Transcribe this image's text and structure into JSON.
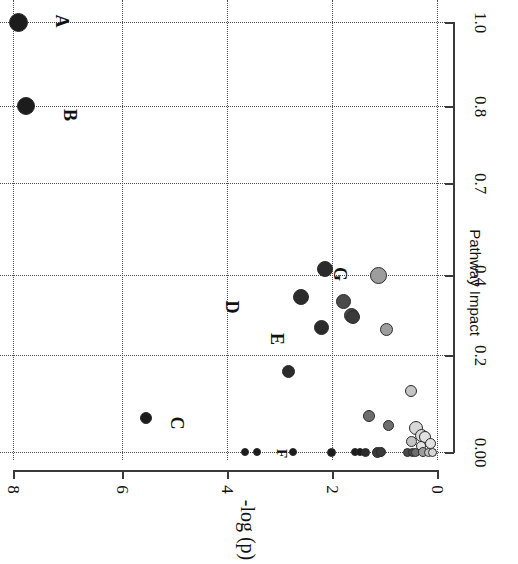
{
  "figure": {
    "kind": "scatter-plot",
    "orientation": "rotated-90-clockwise",
    "background": "#ffffff"
  },
  "chart_data": {
    "type": "scatter",
    "title": "",
    "xlabel": "Pathway Impact",
    "ylabel": "-log (p)",
    "xlim": [
      0.0,
      1.0
    ],
    "ylim": [
      0,
      8
    ],
    "grid": true,
    "legend": null,
    "x_ticks": [
      {
        "label": "0.00",
        "value": 0.0
      },
      {
        "label": "0.2",
        "value": 0.2
      },
      {
        "label": "0.4",
        "value": 0.4
      },
      {
        "label": "0.7",
        "value": 0.7
      },
      {
        "label": "0.8",
        "value": 0.8
      },
      {
        "label": "1.0",
        "value": 1.0
      }
    ],
    "y_ticks": [
      {
        "label": "0",
        "value": 0
      },
      {
        "label": "2",
        "value": 2
      },
      {
        "label": "4",
        "value": 4
      },
      {
        "label": "6",
        "value": 6
      },
      {
        "label": "8",
        "value": 8
      }
    ],
    "point_annotations": [
      {
        "id": "A",
        "label": "A"
      },
      {
        "id": "B",
        "label": "B"
      },
      {
        "id": "C",
        "label": "C"
      },
      {
        "id": "D",
        "label": "D"
      },
      {
        "id": "E",
        "label": "E"
      },
      {
        "id": "F",
        "label": "F"
      },
      {
        "id": "G",
        "label": "G"
      }
    ],
    "points": [
      {
        "label": "A",
        "x": 1.0,
        "y": 7.9,
        "size": 19,
        "color": "#1c1c1c"
      },
      {
        "label": "B",
        "x": 0.8,
        "y": 7.76,
        "size": 18,
        "color": "#1c1c1c"
      },
      {
        "label": "G",
        "x": 0.42,
        "y": 2.12,
        "size": 16,
        "color": "#2b2b2b"
      },
      {
        "label": "D",
        "x": 0.345,
        "y": 2.57,
        "size": 16,
        "color": "#2b2b2b"
      },
      {
        "label": "E",
        "x": 0.27,
        "y": 2.18,
        "size": 15,
        "color": "#2b2b2b"
      },
      {
        "label": "C",
        "x": 0.07,
        "y": 5.5,
        "size": 12,
        "color": "#1c1c1c"
      },
      {
        "label": "",
        "x": 0.4,
        "y": 1.1,
        "size": 17,
        "color": "#9d9d9d"
      },
      {
        "label": "",
        "x": 0.335,
        "y": 1.76,
        "size": 15,
        "color": "#4a4a4a"
      },
      {
        "label": "",
        "x": 0.3,
        "y": 1.62,
        "size": 15,
        "color": "#4a4a4a"
      },
      {
        "label": "",
        "x": 0.295,
        "y": 1.58,
        "size": 14,
        "color": "#3a3a3a"
      },
      {
        "label": "",
        "x": 0.265,
        "y": 0.95,
        "size": 13,
        "color": "#9d9d9d"
      },
      {
        "label": "",
        "x": 0.165,
        "y": 2.8,
        "size": 13,
        "color": "#2b2b2b"
      },
      {
        "label": "",
        "x": 0.125,
        "y": 0.5,
        "size": 12,
        "color": "#c4c4c4"
      },
      {
        "label": "",
        "x": 0.075,
        "y": 1.28,
        "size": 12,
        "color": "#6e6e6e"
      },
      {
        "label": "",
        "x": 0.055,
        "y": 0.92,
        "size": 11,
        "color": "#6e6e6e"
      },
      {
        "label": "",
        "x": 0.05,
        "y": 0.4,
        "size": 14,
        "color": "#d7d7d7"
      },
      {
        "label": "",
        "x": 0.035,
        "y": 0.3,
        "size": 13,
        "color": "#d7d7d7"
      },
      {
        "label": "",
        "x": 0.03,
        "y": 0.22,
        "size": 12,
        "color": "#e2e2e2"
      },
      {
        "label": "",
        "x": 0.022,
        "y": 0.48,
        "size": 11,
        "color": "#c4c4c4"
      },
      {
        "label": "",
        "x": 0.018,
        "y": 0.12,
        "size": 11,
        "color": "#e2e2e2"
      },
      {
        "label": "",
        "x": 0.012,
        "y": 0.3,
        "size": 10,
        "color": "#e2e2e2"
      },
      {
        "label": "F",
        "x": 0.0,
        "y": 3.4,
        "size": 8,
        "color": "#1c1c1c"
      },
      {
        "label": "",
        "x": 0.0,
        "y": 3.62,
        "size": 8,
        "color": "#1c1c1c"
      },
      {
        "label": "",
        "x": 0.0,
        "y": 2.72,
        "size": 8,
        "color": "#1c1c1c"
      },
      {
        "label": "",
        "x": 0.0,
        "y": 2.0,
        "size": 9,
        "color": "#1c1c1c"
      },
      {
        "label": "",
        "x": 0.0,
        "y": 1.55,
        "size": 8,
        "color": "#1c1c1c"
      },
      {
        "label": "",
        "x": 0.0,
        "y": 1.45,
        "size": 8,
        "color": "#1c1c1c"
      },
      {
        "label": "",
        "x": 0.0,
        "y": 1.35,
        "size": 9,
        "color": "#2b2b2b"
      },
      {
        "label": "",
        "x": 0.0,
        "y": 1.12,
        "size": 11,
        "color": "#3a3a3a"
      },
      {
        "label": "",
        "x": 0.0,
        "y": 1.05,
        "size": 10,
        "color": "#3a3a3a"
      },
      {
        "label": "",
        "x": 0.0,
        "y": 0.55,
        "size": 9,
        "color": "#4a4a4a"
      },
      {
        "label": "",
        "x": 0.0,
        "y": 0.47,
        "size": 9,
        "color": "#4a4a4a"
      },
      {
        "label": "",
        "x": 0.0,
        "y": 0.4,
        "size": 9,
        "color": "#6e6e6e"
      },
      {
        "label": "",
        "x": 0.0,
        "y": 0.26,
        "size": 10,
        "color": "#9d9d9d"
      },
      {
        "label": "",
        "x": 0.0,
        "y": 0.16,
        "size": 9,
        "color": "#c4c4c4"
      },
      {
        "label": "",
        "x": 0.0,
        "y": 0.08,
        "size": 9,
        "color": "#d7d7d7"
      }
    ]
  },
  "axes": {
    "x_title": "Pathway Impact",
    "y_title": "-log (p)",
    "x_tick_labels": [
      "0.00",
      "0.2",
      "0.4",
      "0.7",
      "0.8",
      "1.0"
    ],
    "y_tick_labels": [
      "0",
      "2",
      "4",
      "6",
      "8"
    ]
  },
  "labels": {
    "A": "A",
    "B": "B",
    "C": "C",
    "D": "D",
    "E": "E",
    "F": "F",
    "G": "G"
  },
  "colors": {
    "axis": "#3a3a3a",
    "grid": "#4a4a4a",
    "text": "#111111",
    "high": "#1c1c1c",
    "mid": "#6e6e6e",
    "low": "#e2e2e2"
  }
}
